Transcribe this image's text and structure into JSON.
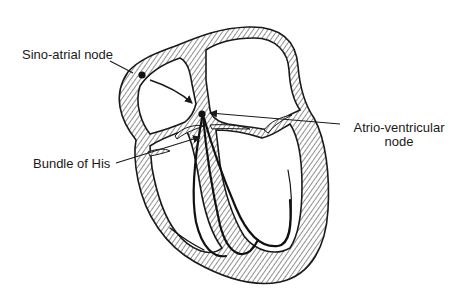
{
  "diagram": {
    "labels": {
      "sa_node": "Sino-atrial node",
      "av_node_line1": "Atrio-ventricular",
      "av_node_line2": "node",
      "bundle_of_his": "Bundle of His"
    },
    "colors": {
      "ink": "#1a1a1a",
      "hatch": "#333333",
      "background": "#ffffff"
    }
  }
}
